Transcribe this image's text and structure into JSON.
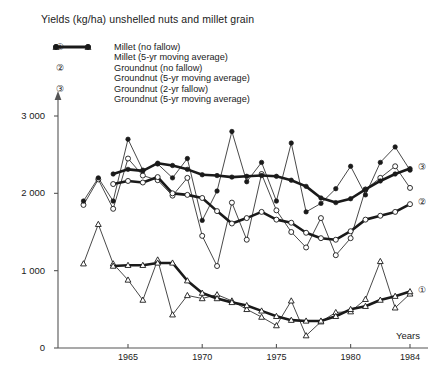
{
  "chart_data": {
    "type": "line",
    "title": "Yields (kg/ha) unshelled nuts and millet grain",
    "xlabel": "Years",
    "ylabel": "",
    "xlim": [
      1962,
      1984
    ],
    "ylim": [
      0,
      3200
    ],
    "yticks": [
      0,
      1000,
      2000,
      3000
    ],
    "ytick_labels": [
      "0",
      "1 000",
      "2 000",
      "3 000"
    ],
    "xticks": [
      1965,
      1970,
      1975,
      1980,
      1984
    ],
    "xtick_labels": [
      "1965",
      "1970",
      "1975",
      "1980",
      "1984"
    ],
    "grid": false,
    "legend_position": "top-left",
    "x": [
      1962,
      1963,
      1964,
      1965,
      1966,
      1967,
      1968,
      1969,
      1970,
      1971,
      1972,
      1973,
      1974,
      1975,
      1976,
      1977,
      1978,
      1979,
      1980,
      1981,
      1982,
      1983,
      1984
    ],
    "series": [
      {
        "name": "Millet (no fallow)",
        "marker": "open-triangle",
        "line": "thin",
        "values": [
          1090,
          1600,
          1090,
          880,
          620,
          1140,
          430,
          680,
          640,
          690,
          610,
          500,
          400,
          290,
          610,
          160,
          340,
          460,
          470,
          630,
          1120,
          520,
          700
        ]
      },
      {
        "name": "Millet (5-yr moving average)",
        "marker": "open-triangle",
        "line": "thick",
        "values": [
          null,
          null,
          1060,
          1070,
          1070,
          1100,
          1100,
          870,
          710,
          640,
          590,
          550,
          480,
          410,
          360,
          350,
          350,
          410,
          500,
          540,
          620,
          670,
          730
        ]
      },
      {
        "name": "Groundnut (no fallow)",
        "marker": "open-circle",
        "line": "thin",
        "values": [
          1850,
          2180,
          1800,
          2450,
          2230,
          2170,
          1970,
          2200,
          1450,
          1060,
          1880,
          1400,
          2250,
          1780,
          1500,
          1300,
          1680,
          1200,
          1420,
          2050,
          2200,
          2350,
          2070
        ]
      },
      {
        "name": "Groundnut (5-yr moving average)",
        "marker": "open-circle",
        "line": "thick",
        "values": [
          null,
          null,
          2120,
          2160,
          2140,
          2210,
          2000,
          1980,
          1940,
          1770,
          1610,
          1680,
          1760,
          1660,
          1620,
          1490,
          1420,
          1400,
          1510,
          1660,
          1710,
          1760,
          1860
        ]
      },
      {
        "name": "Groundnut (2-yr fallow)",
        "marker": "filled-circle",
        "line": "thin",
        "values": [
          1900,
          2200,
          1900,
          2700,
          2300,
          2380,
          2200,
          2450,
          1650,
          2030,
          2800,
          2150,
          2400,
          1900,
          2650,
          1760,
          1870,
          2060,
          2350,
          1980,
          2400,
          2600,
          2300
        ]
      },
      {
        "name": "Groundnut (5-yr moving average)",
        "marker": "filled-circle",
        "line": "thick",
        "values": [
          null,
          null,
          2250,
          2310,
          2290,
          2390,
          2360,
          2310,
          2240,
          2230,
          2210,
          2220,
          2230,
          2220,
          2170,
          2090,
          1940,
          1880,
          1930,
          2050,
          2160,
          2250,
          2320
        ]
      }
    ],
    "annotations": [
      {
        "label": "①",
        "series": "Millet",
        "at_year": 1984,
        "at_value": 730
      },
      {
        "label": "②",
        "series": "Groundnut (no fallow)",
        "at_year": 1984,
        "at_value": 1860
      },
      {
        "label": "③",
        "series": "Groundnut (2-yr fallow)",
        "at_year": 1984,
        "at_value": 2320
      }
    ]
  },
  "legend": {
    "groups": [
      {
        "number": "①",
        "entries": [
          {
            "label": "Millet (no fallow)",
            "marker": "open-triangle",
            "line": "thin"
          },
          {
            "label": "Millet (5-yr moving average)",
            "marker": "open-triangle",
            "line": "thick"
          }
        ]
      },
      {
        "number": "②",
        "entries": [
          {
            "label": "Groundnut (no fallow)",
            "marker": "open-circle",
            "line": "thin"
          },
          {
            "label": "Groundnut (5-yr moving average)",
            "marker": "open-circle",
            "line": "thick"
          }
        ]
      },
      {
        "number": "③",
        "entries": [
          {
            "label": "Groundnut (2-yr fallow)",
            "marker": "filled-circle",
            "line": "thin"
          },
          {
            "label": "Groundnut (5-yr moving average)",
            "marker": "filled-circle",
            "line": "thick"
          }
        ]
      }
    ]
  },
  "colors": {
    "ink": "#1a1a1a",
    "axis": "#555555",
    "background": "#ffffff"
  }
}
